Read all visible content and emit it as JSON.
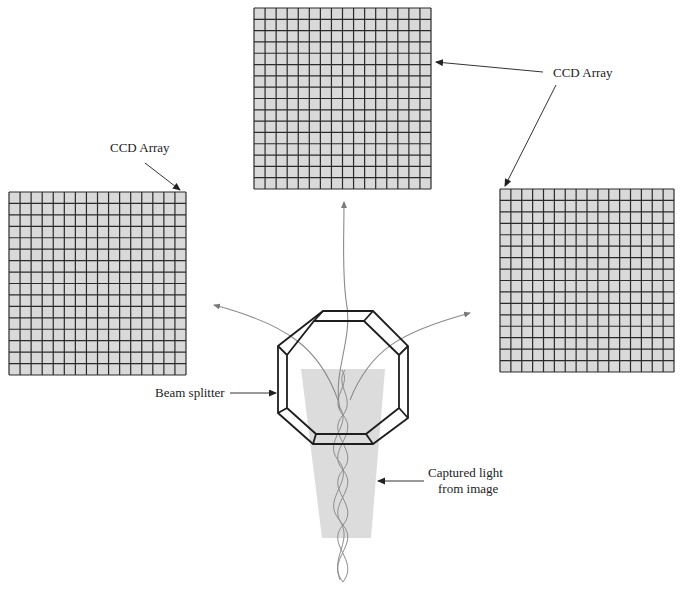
{
  "diagram": {
    "labels": {
      "ccd_array_top": "CCD Array",
      "ccd_array_left": "CCD Array",
      "beam_splitter": "Beam splitter",
      "captured_light_line1": "Captured light",
      "captured_light_line2": "from image"
    },
    "ccd_arrays": [
      {
        "id": "left",
        "rows": 16,
        "cols": 16
      },
      {
        "id": "top",
        "rows": 16,
        "cols": 16
      },
      {
        "id": "right",
        "rows": 16,
        "cols": 16
      }
    ],
    "colors": {
      "cell_fill": "#d9d9d9",
      "grid_line": "#2a2a2a",
      "light_cone": "#dcdcdc",
      "rays": "#8a8a8a",
      "prism": "#1e1e1e"
    }
  }
}
